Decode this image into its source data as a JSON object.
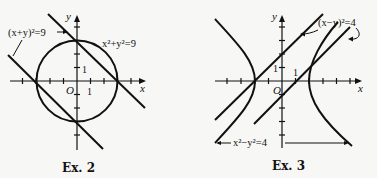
{
  "figures": [
    {
      "caption": "Ex. 2",
      "axis_x": "x",
      "axis_y": "y",
      "origin_label": "O",
      "tick_label_x": "1",
      "tick_label_y": "1",
      "labels": {
        "lines": "(x+y)²=9",
        "circle": "x²+y²=9"
      }
    },
    {
      "caption": "Ex. 3",
      "axis_x": "x",
      "axis_y": "y",
      "origin_label": "O",
      "tick_label_x": "1",
      "tick_label_y": "1",
      "labels": {
        "lines": "(x−y)²=4",
        "hyperbola": "x²−y²=4"
      }
    }
  ]
}
